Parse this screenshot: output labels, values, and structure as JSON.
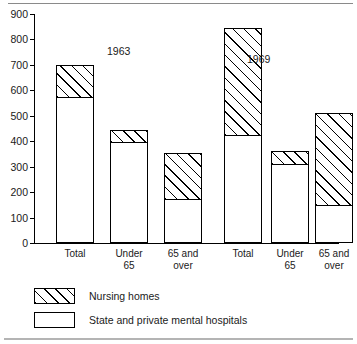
{
  "chart_data": {
    "type": "bar",
    "stacked": true,
    "title": "",
    "subtitle": "",
    "xlabel": "",
    "ylabel": "",
    "ylim": [
      0,
      900
    ],
    "ytick_step": 100,
    "yticks": [
      "0",
      "100",
      "200",
      "300",
      "400",
      "500",
      "600",
      "700",
      "800",
      "900"
    ],
    "grid": false,
    "legend_position": "bottom-left",
    "groups": [
      {
        "name": "1963",
        "label": "1963"
      },
      {
        "name": "1969",
        "label": "1969"
      }
    ],
    "categories": [
      "Total",
      "Under\n65",
      "65 and\nover"
    ],
    "series": [
      {
        "name": "State and private mental hospitals",
        "key": "mental_hospitals",
        "pattern": "solid"
      },
      {
        "name": "Nursing homes",
        "key": "nursing_homes",
        "pattern": "hatch"
      }
    ],
    "bars": [
      {
        "group": "1963",
        "category": "Total",
        "label": "Total",
        "mental_hospitals": 575,
        "nursing_homes": 125,
        "total": 700
      },
      {
        "group": "1963",
        "category": "Under 65",
        "label": "Under\n65",
        "mental_hospitals": 398,
        "nursing_homes": 47,
        "total": 445
      },
      {
        "group": "1963",
        "category": "65 and over",
        "label": "65 and\nover",
        "mental_hospitals": 172,
        "nursing_homes": 183,
        "total": 355
      },
      {
        "group": "1969",
        "category": "Total",
        "label": "Total",
        "mental_hospitals": 425,
        "nursing_homes": 420,
        "total": 845
      },
      {
        "group": "1969",
        "category": "Under 65",
        "label": "Under\n65",
        "mental_hospitals": 310,
        "nursing_homes": 50,
        "total": 360
      },
      {
        "group": "1969",
        "category": "65 and over",
        "label": "65 and\nover",
        "mental_hospitals": 148,
        "nursing_homes": 364,
        "total": 512
      }
    ]
  },
  "legend": {
    "items": [
      {
        "label": "Nursing homes",
        "pattern": "hatch"
      },
      {
        "label": "State and private mental hospitals",
        "pattern": "solid"
      }
    ]
  },
  "colors": {
    "ink": "#000000",
    "background": "#ffffff",
    "frame": "#8a8a8a"
  }
}
